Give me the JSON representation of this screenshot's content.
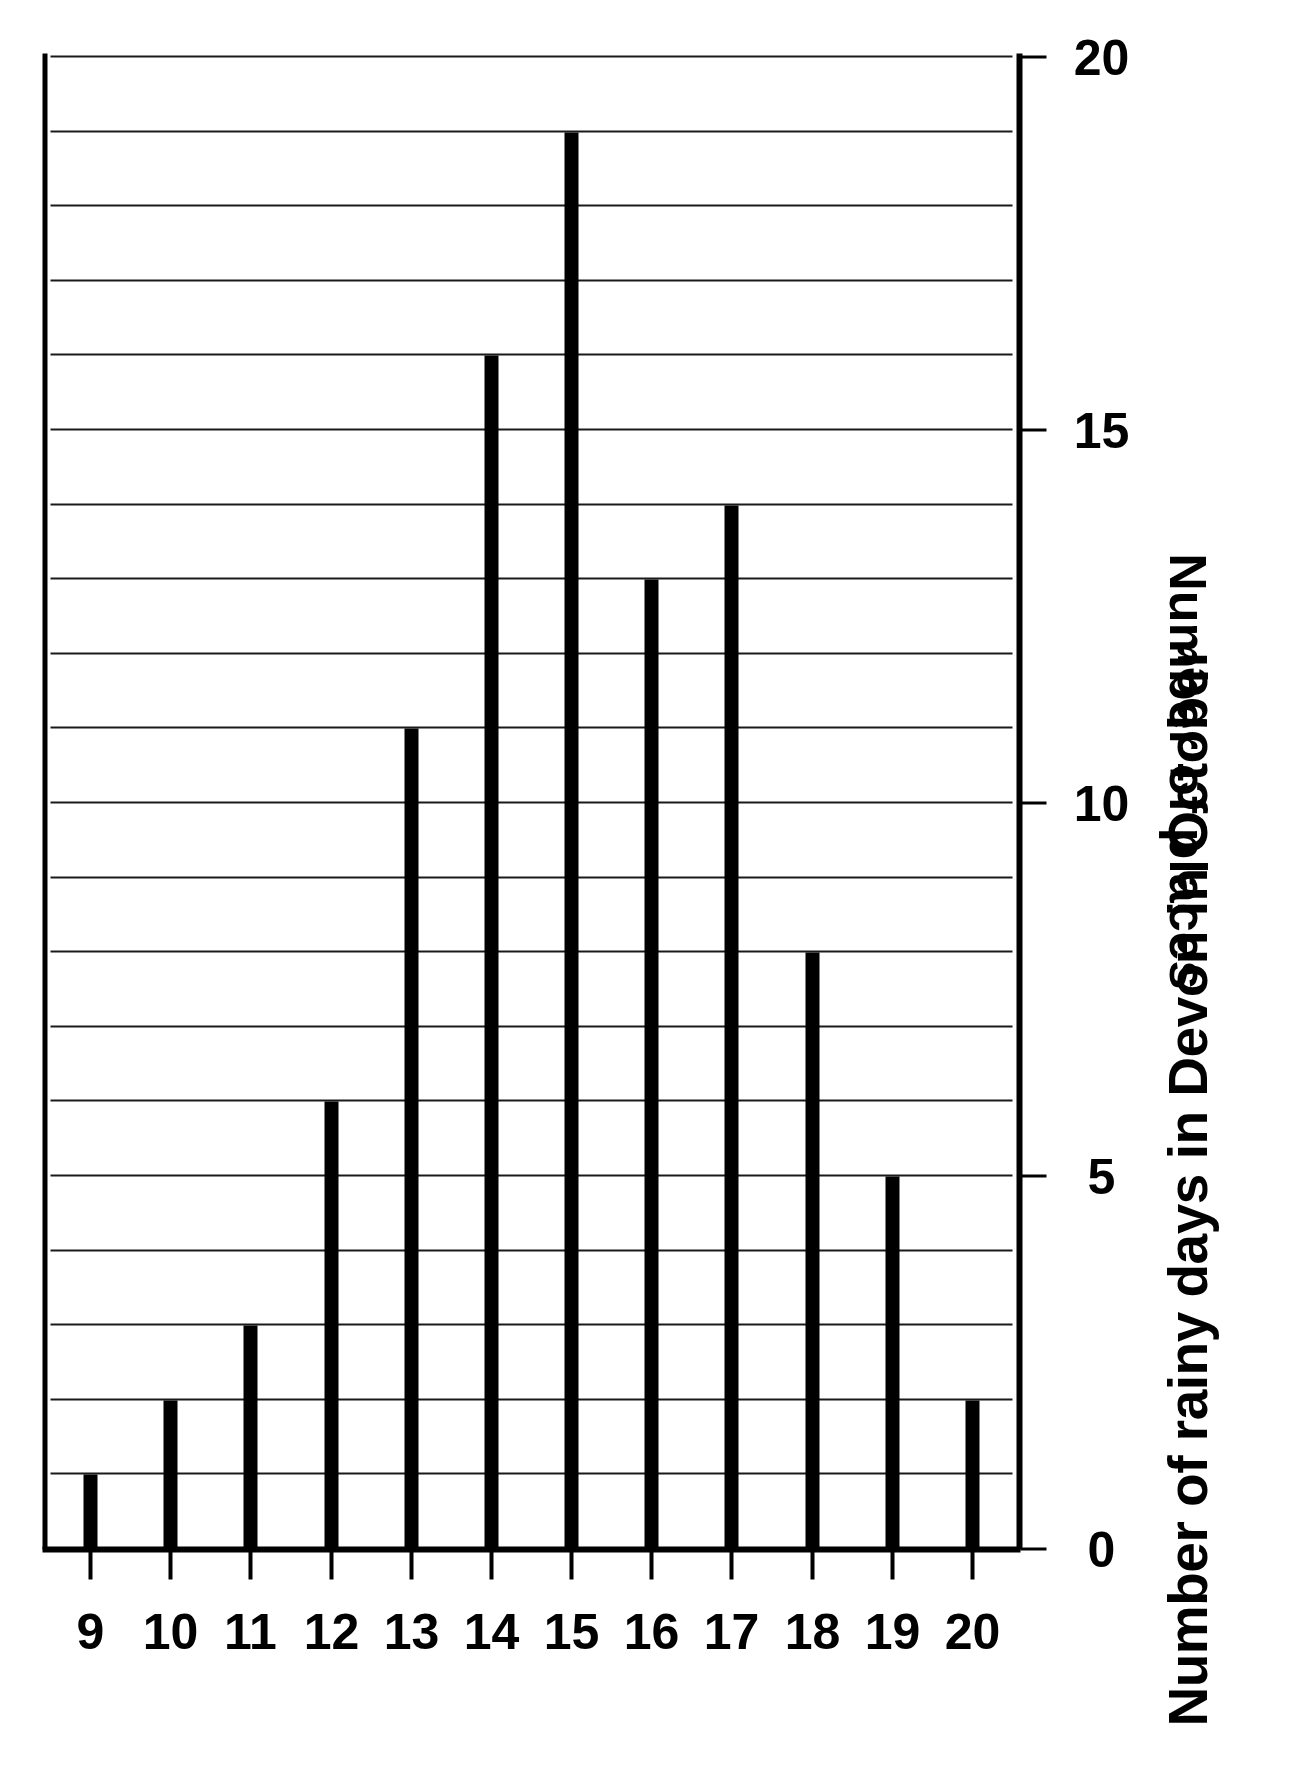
{
  "chart_data": {
    "type": "bar",
    "orientation": "vertical",
    "title": "Number of rainy days in Devon in October",
    "xlabel": "",
    "ylabel": "Number of places",
    "categories": [
      "9",
      "10",
      "11",
      "12",
      "13",
      "14",
      "15",
      "16",
      "17",
      "18",
      "19",
      "20"
    ],
    "values": [
      1,
      2,
      3,
      6,
      11,
      16,
      19,
      13,
      14,
      8,
      5,
      2
    ],
    "ylim": [
      0,
      20
    ],
    "ytick_labels": [
      "0",
      "5",
      "10",
      "15",
      "20"
    ],
    "ytick_values": [
      0,
      5,
      10,
      15,
      20
    ],
    "grid": "vertical gridlines every 1 unit of the value axis",
    "legend": "none",
    "bar_color": "#000000",
    "background_color": "#ffffff",
    "page_rotation_degrees": -90
  },
  "axis": {
    "value_ticks": [
      {
        "label": "0",
        "value": 0
      },
      {
        "label": "5",
        "value": 5
      },
      {
        "label": "10",
        "value": 10
      },
      {
        "label": "15",
        "value": 15
      },
      {
        "label": "20",
        "value": 20
      }
    ]
  }
}
